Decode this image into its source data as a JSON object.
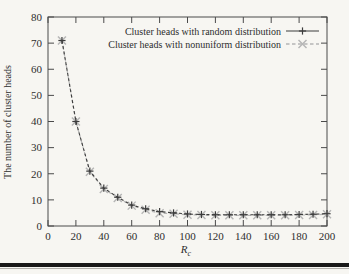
{
  "page": {
    "background_color": "#f7f6f2",
    "footer_rule_color": "#191919"
  },
  "chart_data": {
    "type": "line",
    "title": "",
    "xlabel": "Rc",
    "xlabel_parts": {
      "base": "R",
      "subscript": "c"
    },
    "ylabel": "The number of cluster heads",
    "xlim": [
      0,
      200
    ],
    "ylim": [
      0,
      80
    ],
    "xticks": [
      0,
      20,
      40,
      60,
      80,
      100,
      120,
      140,
      160,
      180,
      200
    ],
    "yticks": [
      0,
      10,
      20,
      30,
      40,
      50,
      60,
      70,
      80
    ],
    "grid": false,
    "legend_position": "top-right-inside",
    "axis_color": "#4a4a4a",
    "x": [
      10,
      20,
      30,
      40,
      50,
      60,
      70,
      80,
      90,
      100,
      110,
      120,
      130,
      140,
      150,
      160,
      170,
      180,
      190,
      200
    ],
    "series": [
      {
        "name": "Cluster heads with random distribution",
        "marker": "+",
        "color": "#3c3c3c",
        "values": [
          71,
          40,
          21,
          14.5,
          11,
          8,
          6.6,
          5.5,
          5,
          4.6,
          4.4,
          4.3,
          4.3,
          4.3,
          4.3,
          4.3,
          4.3,
          4.4,
          4.5,
          4.7
        ]
      },
      {
        "name": "Cluster heads with nonuniform distribution",
        "marker": "x",
        "color": "#b5b5b5",
        "values": [
          71,
          40,
          20.8,
          14.2,
          10.7,
          7.8,
          6.2,
          4.9,
          4.7,
          4.3,
          4.2,
          4.1,
          4.1,
          4.1,
          4.1,
          4.1,
          4.1,
          4.2,
          4.2,
          4.5
        ]
      }
    ]
  }
}
